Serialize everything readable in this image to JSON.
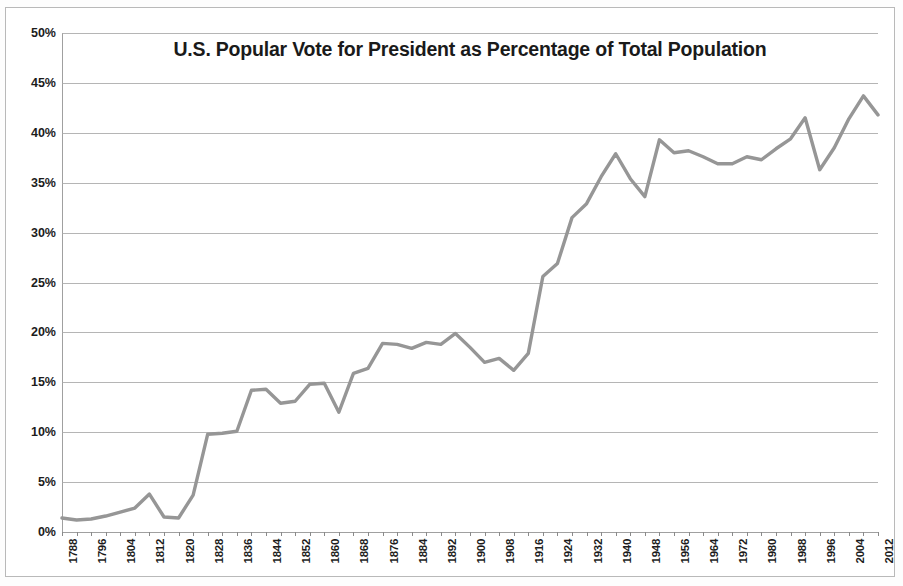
{
  "chart_data": {
    "type": "line",
    "title": "U.S. Popular Vote for President as Percentage of Total Population",
    "xlabel": "",
    "ylabel": "",
    "ylim": [
      0,
      50
    ],
    "xlim": [
      1788,
      2012
    ],
    "grid": true,
    "legend": false,
    "y_ticks": [
      "0%",
      "5%",
      "10%",
      "15%",
      "20%",
      "25%",
      "30%",
      "35%",
      "40%",
      "45%",
      "50%"
    ],
    "y_tick_values": [
      0,
      5,
      10,
      15,
      20,
      25,
      30,
      35,
      40,
      45,
      50
    ],
    "x_tick_labels": [
      "1788",
      "1796",
      "1804",
      "1812",
      "1820",
      "1828",
      "1836",
      "1844",
      "1852",
      "1860",
      "1868",
      "1876",
      "1884",
      "1892",
      "1900",
      "1908",
      "1916",
      "1924",
      "1932",
      "1940",
      "1948",
      "1956",
      "1964",
      "1972",
      "1980",
      "1988",
      "1996",
      "2004",
      "2012"
    ],
    "line_color": "#969696",
    "grid_color": "#a8a8a8",
    "x": [
      1788,
      1792,
      1796,
      1800,
      1804,
      1808,
      1812,
      1816,
      1820,
      1824,
      1828,
      1832,
      1836,
      1840,
      1844,
      1848,
      1852,
      1856,
      1860,
      1864,
      1868,
      1872,
      1876,
      1880,
      1884,
      1888,
      1892,
      1896,
      1900,
      1904,
      1908,
      1912,
      1916,
      1920,
      1924,
      1928,
      1932,
      1936,
      1940,
      1944,
      1948,
      1952,
      1956,
      1960,
      1964,
      1968,
      1972,
      1976,
      1980,
      1984,
      1988,
      1992,
      1996,
      2000,
      2004,
      2008,
      2012
    ],
    "values": [
      1.4,
      1.2,
      1.3,
      1.6,
      2.0,
      2.4,
      3.8,
      1.5,
      1.4,
      3.7,
      9.8,
      9.9,
      10.1,
      14.2,
      14.3,
      12.9,
      13.1,
      14.8,
      14.9,
      12.0,
      15.9,
      16.4,
      18.9,
      18.8,
      18.4,
      19.0,
      18.8,
      19.9,
      18.5,
      17.0,
      17.4,
      16.2,
      17.9,
      25.6,
      26.9,
      31.5,
      32.9,
      35.6,
      37.9,
      35.4,
      33.6,
      39.3,
      38.0,
      38.2,
      37.6,
      36.9,
      36.9,
      37.6,
      37.3,
      38.4,
      39.4,
      41.5,
      36.3,
      38.5,
      41.4,
      43.7,
      41.8
    ]
  },
  "labels": {
    "y_axis_name": "percentage-of-total-population",
    "x_axis_name": "election-year"
  }
}
